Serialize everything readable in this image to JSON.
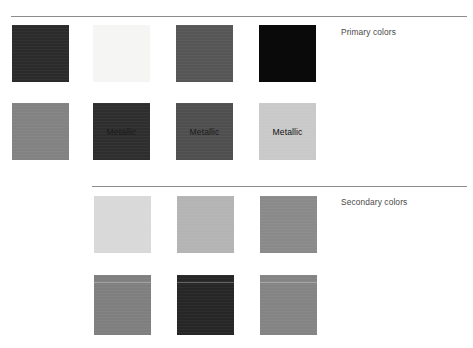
{
  "page": {
    "background": "#ffffff"
  },
  "sections": [
    {
      "id": "primary",
      "label": "Primary colors",
      "rule_color": "#8d8d8d"
    },
    {
      "id": "secondary",
      "label": "Secondary colors",
      "rule_color": "#8d8d8d"
    }
  ],
  "swatches": {
    "primary_row1": [
      {
        "name": "primary-1",
        "color": "#2b2b2b",
        "caption": "",
        "x": 12,
        "y": 25,
        "w": 57,
        "h": 57
      },
      {
        "name": "primary-2",
        "color": "#f5f5f3",
        "caption": "",
        "x": 93,
        "y": 25,
        "w": 57,
        "h": 57
      },
      {
        "name": "primary-3",
        "color": "#565656",
        "caption": "",
        "x": 176,
        "y": 25,
        "w": 57,
        "h": 57
      },
      {
        "name": "primary-4",
        "color": "#0a0a0a",
        "caption": "",
        "x": 259,
        "y": 25,
        "w": 57,
        "h": 57
      }
    ],
    "primary_row2": [
      {
        "name": "primary-5",
        "color": "#828282",
        "caption": "",
        "x": 12,
        "y": 103,
        "w": 57,
        "h": 57
      },
      {
        "name": "primary-6",
        "color": "#2e2e2e",
        "caption": "Metallic",
        "x": 93,
        "y": 103,
        "w": 57,
        "h": 57
      },
      {
        "name": "primary-7",
        "color": "#4f4f4f",
        "caption": "Metallic",
        "x": 176,
        "y": 103,
        "w": 57,
        "h": 57
      },
      {
        "name": "primary-8",
        "color": "#c9c9c9",
        "caption": "Metallic",
        "x": 259,
        "y": 103,
        "w": 57,
        "h": 57
      }
    ],
    "secondary_row1": [
      {
        "name": "secondary-1",
        "color": "#d9d9d9",
        "caption": "",
        "x": 94,
        "y": 196,
        "w": 57,
        "h": 57
      },
      {
        "name": "secondary-2",
        "color": "#b4b4b4",
        "caption": "",
        "x": 177,
        "y": 196,
        "w": 57,
        "h": 57
      },
      {
        "name": "secondary-3",
        "color": "#8a8a8a",
        "caption": "",
        "x": 260,
        "y": 196,
        "w": 57,
        "h": 57
      }
    ],
    "secondary_row2": [
      {
        "name": "secondary-4",
        "color": "#7f7f7f",
        "caption": "",
        "x": 94,
        "y": 275,
        "w": 57,
        "h": 60
      },
      {
        "name": "secondary-5",
        "color": "#262626",
        "caption": "",
        "x": 177,
        "y": 275,
        "w": 57,
        "h": 60
      },
      {
        "name": "secondary-6",
        "color": "#848484",
        "caption": "",
        "x": 260,
        "y": 275,
        "w": 57,
        "h": 60
      }
    ]
  }
}
